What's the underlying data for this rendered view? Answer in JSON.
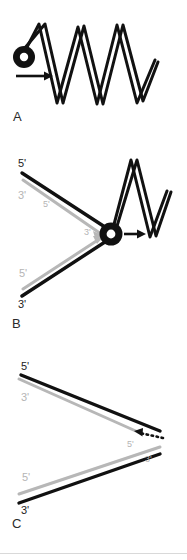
{
  "figure": {
    "background_color": "#ffffff",
    "stroke_black": "#111111",
    "stroke_gray": "#b7b7b7",
    "panels": [
      {
        "id": "A",
        "label": "A",
        "caption_text": "A",
        "description": "Double-stranded DNA helix with helicase marked as a black ring moving right",
        "elements": {
          "helicase_ring": "black-ring",
          "direction_arrow": "right-arrow"
        }
      },
      {
        "id": "B",
        "label": "B",
        "caption_text": "B",
        "description": "Replication fork: two unwound template strands with new strands, helicase ring at fork moving right",
        "end_labels": [
          {
            "text": "5'",
            "color": "black",
            "strand": "upper-template-left-end"
          },
          {
            "text": "3'",
            "color": "gray",
            "strand": "upper-new-left-end"
          },
          {
            "text": "5'",
            "color": "gray",
            "strand": "upper-new-mid"
          },
          {
            "text": "3'",
            "color": "gray",
            "strand": "lower-new-right-end"
          },
          {
            "text": "5'",
            "color": "gray",
            "strand": "lower-new-left-end"
          },
          {
            "text": "3'",
            "color": "black",
            "strand": "lower-template-left-end"
          }
        ],
        "elements": {
          "helicase_ring": "black-ring",
          "direction_arrow": "right-arrow"
        }
      },
      {
        "id": "C",
        "label": "C",
        "caption_text": "C",
        "description": "Separated fork arms: leading and lagging strands with dotted Okazaki synthesis arrow",
        "end_labels": [
          {
            "text": "5'",
            "color": "black",
            "strand": "upper-template-left-end"
          },
          {
            "text": "3'",
            "color": "gray",
            "strand": "upper-new-left-end"
          },
          {
            "text": "5'",
            "color": "gray",
            "strand": "upper-new-right-end"
          },
          {
            "text": "3'",
            "color": "gray",
            "strand": "lower-new-right-end"
          },
          {
            "text": "5'",
            "color": "gray",
            "strand": "lower-new-left-end"
          },
          {
            "text": "3'",
            "color": "black",
            "strand": "lower-template-left-end"
          }
        ],
        "elements": {
          "dotted_arrow": "dotted-left-arrow"
        }
      }
    ]
  },
  "labels": {
    "panel_a": "A",
    "panel_b": "B",
    "panel_c": "C",
    "five_prime": "5'",
    "three_prime": "3'"
  }
}
